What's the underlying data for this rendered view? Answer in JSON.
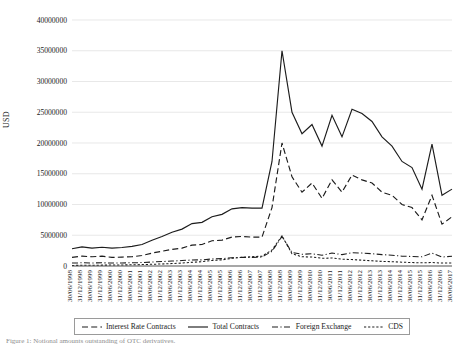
{
  "figure": {
    "ylabel": "USD",
    "caption": "Figure 1: Notional amounts outstanding of OTC derivatives.",
    "legend": [
      {
        "label": "Interest Rate Contracts",
        "style": "dashed",
        "icon": "dashed-line-icon"
      },
      {
        "label": "Total Contracts",
        "style": "solid",
        "icon": "solid-line-icon"
      },
      {
        "label": "Foreign Exchange",
        "style": "dash-dot",
        "icon": "dash-dot-line-icon"
      },
      {
        "label": "CDS",
        "style": "dotted",
        "icon": "dotted-line-icon"
      }
    ]
  },
  "chart_data": {
    "type": "line",
    "title": "",
    "xlabel": "",
    "ylabel": "USD",
    "ylim": [
      0,
      40000000
    ],
    "yticks": [
      0,
      5000000,
      10000000,
      15000000,
      20000000,
      25000000,
      30000000,
      35000000,
      40000000
    ],
    "ytick_labels": [
      "0",
      "5000000",
      "10000000",
      "15000000",
      "20000000",
      "25000000",
      "30000000",
      "35000000",
      "40000000"
    ],
    "grid": true,
    "legend_position": "bottom",
    "categories": [
      "30/06/1998",
      "31/12/1998",
      "30/06/1999",
      "31/12/1999",
      "30/06/2000",
      "31/12/2000",
      "30/06/2001",
      "31/12/2001",
      "30/06/2002",
      "31/12/2002",
      "30/06/2003",
      "31/12/2003",
      "30/06/2004",
      "31/12/2004",
      "30/06/2005",
      "31/12/2005",
      "30/06/2006",
      "31/12/2006",
      "30/06/2007",
      "31/12/2007",
      "30/06/2008",
      "31/12/2008",
      "30/06/2009",
      "31/12/2009",
      "30/06/2010",
      "31/12/2010",
      "30/06/2011",
      "31/12/2011",
      "30/06/2012",
      "31/12/2012",
      "30/06/2013",
      "31/12/2013",
      "30/06/2014",
      "31/12/2014",
      "30/06/2015",
      "31/12/2015",
      "30/06/2016",
      "31/12/2016",
      "30/06/2017"
    ],
    "series": [
      {
        "name": "Total Contracts",
        "style": "solid",
        "values": [
          2800000,
          3100000,
          2900000,
          3050000,
          2900000,
          3000000,
          3200000,
          3500000,
          4200000,
          4800000,
          5500000,
          6000000,
          6900000,
          7100000,
          8000000,
          8400000,
          9300000,
          9500000,
          9400000,
          9400000,
          17000000,
          35000000,
          25000000,
          21500000,
          23000000,
          19500000,
          24500000,
          21000000,
          25500000,
          24800000,
          23500000,
          21000000,
          19500000,
          17000000,
          16000000,
          12500000,
          19800000,
          11500000,
          12500000
        ]
      },
      {
        "name": "Interest Rate Contracts",
        "style": "dashed",
        "values": [
          1400000,
          1600000,
          1500000,
          1600000,
          1400000,
          1450000,
          1500000,
          1700000,
          2100000,
          2400000,
          2700000,
          2900000,
          3400000,
          3500000,
          4100000,
          4200000,
          4700000,
          4800000,
          4700000,
          4700000,
          9500000,
          20000000,
          14500000,
          12000000,
          13500000,
          11000000,
          14000000,
          12000000,
          14800000,
          14000000,
          13500000,
          12000000,
          11500000,
          10000000,
          9500000,
          7500000,
          11500000,
          6800000,
          8000000
        ]
      },
      {
        "name": "Foreign Exchange",
        "style": "dash-dot",
        "values": [
          480000,
          520000,
          500000,
          520000,
          480000,
          500000,
          520000,
          560000,
          650000,
          720000,
          800000,
          880000,
          980000,
          1000000,
          1150000,
          1200000,
          1350000,
          1400000,
          1400000,
          1450000,
          2400000,
          4800000,
          2200000,
          1900000,
          2000000,
          1750000,
          2100000,
          1850000,
          2150000,
          2100000,
          2000000,
          1850000,
          1750000,
          1600000,
          1550000,
          1500000,
          2100000,
          1450000,
          1600000
        ]
      },
      {
        "name": "CDS",
        "style": "dotted",
        "values": [
          90000,
          110000,
          120000,
          140000,
          150000,
          170000,
          200000,
          230000,
          280000,
          330000,
          400000,
          480000,
          600000,
          700000,
          900000,
          1000000,
          1250000,
          1400000,
          1500000,
          1600000,
          2600000,
          4900000,
          2000000,
          1500000,
          1450000,
          1250000,
          1300000,
          1100000,
          1050000,
          950000,
          850000,
          750000,
          700000,
          620000,
          560000,
          520000,
          560000,
          480000,
          500000
        ]
      }
    ]
  }
}
